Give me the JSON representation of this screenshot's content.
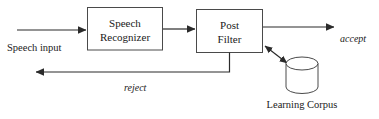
{
  "diagram": {
    "background_color": "#ffffff",
    "line_color": "#2b2b2b",
    "box_stroke_color": "#4a4a4a",
    "text_color": "#1a1a1a",
    "nodes": [
      {
        "id": "speech-recognizer",
        "shape": "rectangle",
        "label_line1": "Speech",
        "label_line2": "Recognizer"
      },
      {
        "id": "post-filter",
        "shape": "rectangle",
        "label_line1": "Post",
        "label_line2": "Filter"
      },
      {
        "id": "learning-corpus",
        "shape": "cylinder",
        "label": "Learning Corpus"
      }
    ],
    "edge_labels": {
      "input": "Speech input",
      "accept": "accept",
      "reject": "reject"
    }
  }
}
